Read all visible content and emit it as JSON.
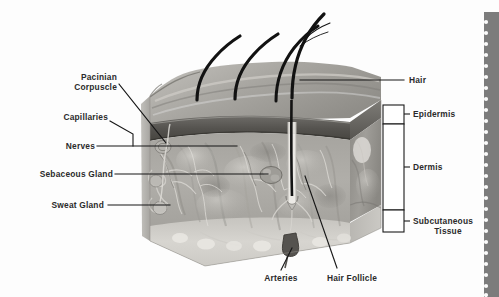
{
  "figure": {
    "background_color": "#fdfdfd",
    "label_color": "#2b2b2b",
    "leader_color": "#161616"
  },
  "labels": {
    "pacinian_corpuscle_line1": "Pacinian",
    "pacinian_corpuscle_line2": "Corpuscle",
    "capillaries": "Capillaries",
    "nerves": "Nerves",
    "sebaceous_gland": "Sebaceous Gland",
    "sweat_gland": "Sweat Gland",
    "hair": "Hair",
    "epidermis": "Epidermis",
    "dermis": "Dermis",
    "subcutaneous_line1": "Subcutaneous",
    "subcutaneous_line2": "Tissue",
    "arteries": "Arteries",
    "hair_follicle": "Hair Follicle"
  },
  "layers": [
    {
      "name": "Epidermis",
      "bracket": "top"
    },
    {
      "name": "Dermis",
      "bracket": "middle"
    },
    {
      "name": "Subcutaneous Tissue",
      "bracket": "bottom"
    }
  ],
  "structures": [
    "Pacinian Corpuscle",
    "Capillaries",
    "Nerves",
    "Sebaceous Gland",
    "Sweat Gland",
    "Hair",
    "Arteries",
    "Hair Follicle"
  ],
  "page_edge": {
    "type": "perforated-binding-strip",
    "color": "#7c7c7c",
    "perforation_color": "#fbfbfb",
    "perforation_count": 26
  }
}
